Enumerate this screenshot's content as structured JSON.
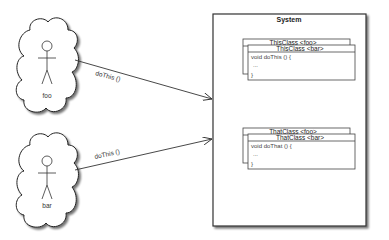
{
  "diagram": {
    "actors": [
      {
        "name": "foo",
        "message": "doThis ()"
      },
      {
        "name": "bar",
        "message": "doThis ()"
      }
    ],
    "system": {
      "title": "System",
      "classes": [
        {
          "back_header": "ThisClass <foo>",
          "front_header": "ThisClass <bar>",
          "body": [
            "void doThis () {",
            "...",
            "}"
          ]
        },
        {
          "back_header": "ThatClass <foo>",
          "front_header": "ThatClass <bar>",
          "body": [
            "void doThat () {",
            "...",
            "}"
          ]
        }
      ]
    },
    "colors": {
      "stroke": "#333333",
      "shadow": "#9a9a9a",
      "background": "#ffffff"
    }
  }
}
